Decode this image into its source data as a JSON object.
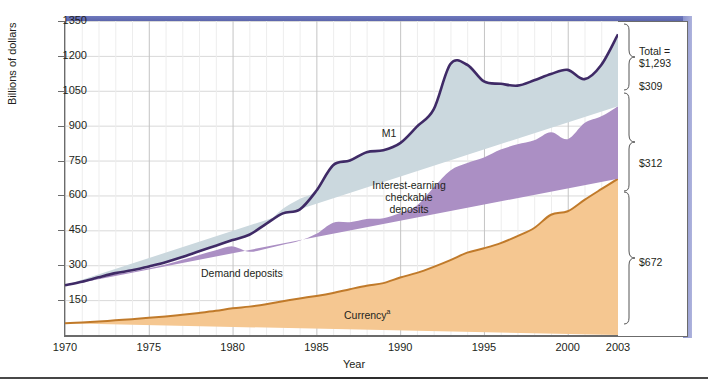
{
  "figure": {
    "axis_title_y": "Billions of dollars",
    "axis_title_x": "Year"
  },
  "annotations": {
    "m1": "M1",
    "iecd_line1": "Interest-earning",
    "iecd_line2": "checkable",
    "iecd_line3": "deposits",
    "demand": "Demand deposits",
    "currency": "Currency",
    "currency_sup": "a"
  },
  "right_labels": {
    "total_line1": "Total =",
    "total_line2": "$1,293",
    "iecd_total": "$309",
    "demand_total": "$312",
    "currency_total": "$672"
  },
  "colors": {
    "band": "#4d569e",
    "m1_line": "#3f2a66",
    "interest_earning": "#cbd8de",
    "demand_deposits": "#ab8fc4",
    "currency": "#f5c791",
    "currency_line": "#c07a2a",
    "grid": "#d9d9d9"
  },
  "chart_data": {
    "type": "area",
    "title": "",
    "xlabel": "Year",
    "ylabel": "Billions of dollars",
    "xlim": [
      1970,
      2003
    ],
    "ylim": [
      0,
      1350
    ],
    "ytick_labels": [
      "150",
      "300",
      "450",
      "600",
      "750",
      "900",
      "1050",
      "1200",
      "1350"
    ],
    "ytick_values": [
      150,
      300,
      450,
      600,
      750,
      900,
      1050,
      1200,
      1350
    ],
    "xtick_labels": [
      "1970",
      "1975",
      "1980",
      "1985",
      "1990",
      "1995",
      "2000",
      "2003"
    ],
    "xtick_values": [
      1970,
      1975,
      1980,
      1985,
      1990,
      1995,
      2000,
      2003
    ],
    "grid": true,
    "legend": "in-chart labels",
    "stacked": true,
    "x": [
      1970,
      1971,
      1972,
      1973,
      1974,
      1975,
      1976,
      1977,
      1978,
      1979,
      1980,
      1981,
      1982,
      1983,
      1984,
      1985,
      1986,
      1987,
      1988,
      1989,
      1990,
      1991,
      1992,
      1993,
      1994,
      1995,
      1996,
      1997,
      1998,
      1999,
      2000,
      2001,
      2002,
      2003
    ],
    "series": [
      {
        "name": "Currency",
        "color": "#f5c791",
        "values": [
          50,
          54,
          58,
          63,
          68,
          74,
          80,
          87,
          95,
          104,
          115,
          122,
          132,
          145,
          157,
          168,
          181,
          197,
          212,
          223,
          247,
          267,
          293,
          322,
          354,
          373,
          395,
          425,
          460,
          517,
          532,
          581,
          627,
          672
        ]
      },
      {
        "name": "Demand deposits",
        "color": "#ab8fc4",
        "values": [
          162,
          172,
          186,
          198,
          204,
          213,
          223,
          236,
          249,
          260,
          266,
          236,
          239,
          243,
          248,
          267,
          302,
          288,
          287,
          279,
          277,
          290,
          341,
          385,
          385,
          390,
          402,
          395,
          377,
          355,
          310,
          330,
          313,
          312
        ]
      },
      {
        "name": "Interest-earning checkable deposits",
        "color": "#cbd8de",
        "values": [
          2,
          3,
          4,
          5,
          6,
          8,
          10,
          12,
          16,
          20,
          27,
          73,
          107,
          155,
          180,
          185,
          247,
          265,
          287,
          292,
          301,
          339,
          336,
          458,
          423,
          327,
          283,
          252,
          258,
          250,
          298,
          189,
          221,
          309
        ]
      }
    ],
    "total_line": {
      "name": "M1",
      "color": "#3f2a66",
      "values": [
        214,
        229,
        248,
        266,
        278,
        295,
        313,
        335,
        360,
        384,
        408,
        431,
        478,
        523,
        539,
        620,
        730,
        750,
        786,
        794,
        825,
        896,
        970,
        1165,
        1162,
        1090,
        1080,
        1072,
        1095,
        1122,
        1140,
        1100,
        1161,
        1293
      ]
    },
    "right_bracket_totals": {
      "total": "$1,293",
      "interest_earning_checkable_deposits": "$309",
      "demand_deposits": "$312",
      "currency": "$672"
    }
  }
}
